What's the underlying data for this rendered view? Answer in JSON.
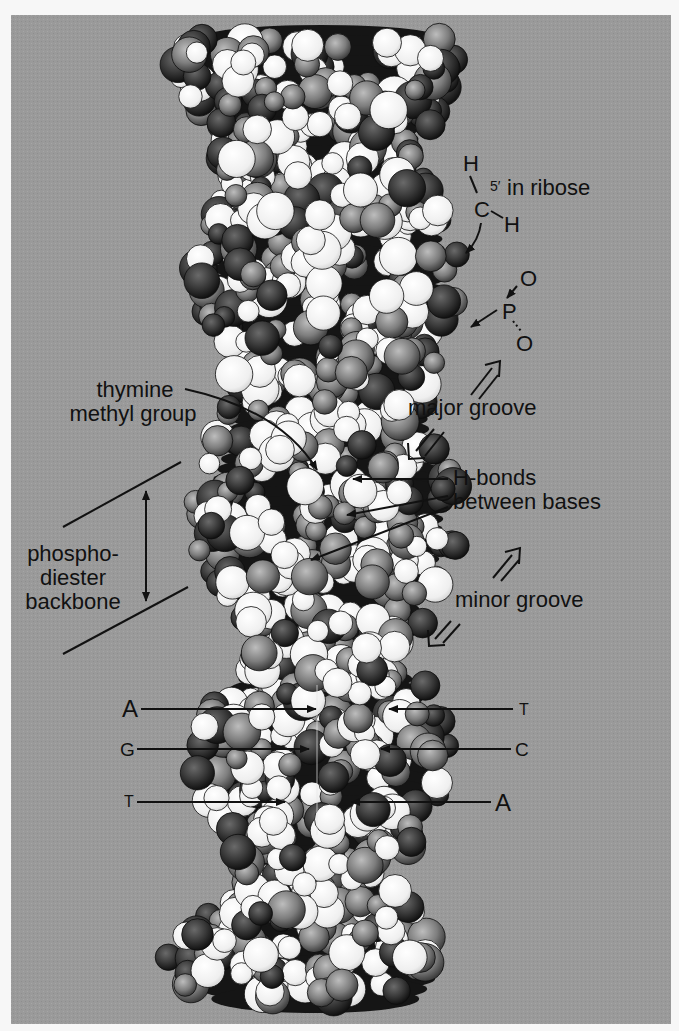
{
  "figure": {
    "background_color": "#9a9a9a",
    "page_color": "#f7f7f7",
    "atom_colors": {
      "light": "#f2f2f2",
      "dark": "#1a1a1a",
      "mid": "#5a5a5a",
      "grey": "#8a8a8a"
    }
  },
  "labels": {
    "ribose": {
      "h_top": "H",
      "c": "C",
      "h_right": "H",
      "text": "5′ in ribose"
    },
    "phosphate": {
      "o_top": "O",
      "p": "P",
      "o_bottom": "O"
    },
    "thymine_line1": "thymine",
    "thymine_line2": "methyl group",
    "major_groove": "major groove",
    "hbonds_line1": "H-bonds",
    "hbonds_line2": "between bases",
    "backbone_line1": "phospho-",
    "backbone_line2": "diester",
    "backbone_line3": "backbone",
    "minor_groove": "minor groove"
  },
  "base_pairs": [
    {
      "left": "A",
      "right": "T"
    },
    {
      "left": "G",
      "right": "C"
    },
    {
      "left": "T",
      "right": "A"
    }
  ]
}
